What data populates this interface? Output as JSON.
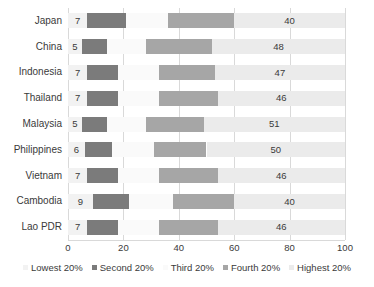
{
  "chart_data": {
    "type": "bar",
    "orientation": "horizontal",
    "stacked": true,
    "title": "",
    "subtitle": "",
    "xlabel": "",
    "ylabel": "",
    "xlim": [
      0,
      100
    ],
    "xticks": [
      0,
      20,
      40,
      60,
      80,
      100
    ],
    "xtick_labels": [
      "0",
      "20",
      "40",
      "60",
      "80",
      "100"
    ],
    "grid": true,
    "grid_axis": "x",
    "legend_position": "bottom",
    "categories": [
      "Japan",
      "China",
      "Indonesia",
      "Thailand",
      "Malaysia",
      "Philippines",
      "Vietnam",
      "Cambodia",
      "Lao PDR"
    ],
    "series": [
      {
        "name": "Lowest 20%",
        "color": "#f2f2f2",
        "values": [
          7,
          5,
          7,
          7,
          5,
          6,
          7,
          9,
          7
        ]
      },
      {
        "name": "Second 20%",
        "color": "#7b7b7b",
        "values": [
          14,
          9,
          11,
          11,
          9,
          10,
          11,
          13,
          11
        ]
      },
      {
        "name": "Third 20%",
        "color": "#fafafa",
        "values": [
          15,
          14,
          15,
          15,
          14,
          15,
          15,
          16,
          15
        ]
      },
      {
        "name": "Fourth 20%",
        "color": "#a6a6a6",
        "values": [
          24,
          24,
          20,
          21,
          21,
          19,
          21,
          22,
          21
        ]
      },
      {
        "name": "Highest 20%",
        "color": "#ebebeb",
        "values": [
          40,
          48,
          47,
          46,
          51,
          50,
          46,
          40,
          46
        ]
      }
    ],
    "visible_value_labels": {
      "Lowest 20%": [
        "7",
        "5",
        "7",
        "7",
        "5",
        "6",
        "7",
        "9",
        "7"
      ],
      "Highest 20%": [
        "40",
        "48",
        "47",
        "46",
        "51",
        "50",
        "46",
        "40",
        "46"
      ]
    },
    "legend": [
      {
        "label": "Lowest 20%",
        "color": "#f2f2f2"
      },
      {
        "label": "Second 20%",
        "color": "#7b7b7b"
      },
      {
        "label": "Third 20%",
        "color": "#fafafa"
      },
      {
        "label": "Fourth 20%",
        "color": "#a6a6a6"
      },
      {
        "label": "Highest 20%",
        "color": "#ebebeb"
      }
    ]
  }
}
